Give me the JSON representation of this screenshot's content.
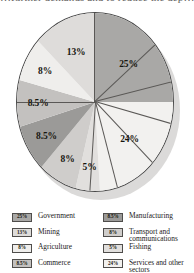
{
  "page": {
    "top_clipped_text": "…further demands and to reduce the dep…"
  },
  "chart_data": {
    "type": "pie",
    "title": "",
    "subtitle": "",
    "xlabel": "",
    "ylabel": "",
    "grid": false,
    "legend_position": "bottom",
    "start_angle_deg": 0,
    "direction": "clockwise",
    "total": 100,
    "unit": "%",
    "categories": [
      "Government",
      "Services and other sectors",
      "Fishing",
      "Transport and communications",
      "Manufacturing",
      "Commerce",
      "Agriculture",
      "Mining"
    ],
    "values": [
      25,
      24,
      5,
      8,
      8.5,
      8.5,
      8,
      13
    ],
    "colors": [
      "#a9a8a6",
      "#f2f1ef",
      "#e1dfdd",
      "#cfcdcb",
      "#9b9a98",
      "#c3c1bf",
      "#efeeec",
      "#dedcda"
    ],
    "slices": [
      {
        "label": "25%",
        "name": "Government",
        "value": 25,
        "color": "#a9a8a6"
      },
      {
        "label": "24%",
        "name": "Services and other sectors",
        "value": 24,
        "color": "#f2f1ef"
      },
      {
        "label": "5%",
        "name": "Fishing",
        "value": 5,
        "color": "#e1dfdd"
      },
      {
        "label": "8%",
        "name": "Transport and communications",
        "value": 8,
        "color": "#cfcdcb"
      },
      {
        "label": "8.5%",
        "name": "Manufacturing",
        "value": 8.5,
        "color": "#9b9a98"
      },
      {
        "label": "8.5%",
        "name": "Commerce",
        "value": 8.5,
        "color": "#c3c1bf"
      },
      {
        "label": "8%",
        "name": "Agriculture",
        "value": 8,
        "color": "#efeeec"
      },
      {
        "label": "13%",
        "name": "Mining",
        "value": 13,
        "color": "#dedcda"
      }
    ]
  },
  "legend": {
    "left_column": [
      {
        "pct": "25%",
        "label": "Government",
        "color": "#a9a8a6"
      },
      {
        "pct": "13%",
        "label": "Mining",
        "color": "#dedcda"
      },
      {
        "pct": "8%",
        "label": "Agriculture",
        "color": "#efeeec"
      },
      {
        "pct": "8.5%",
        "label": "Commerce",
        "color": "#c3c1bf"
      }
    ],
    "right_column": [
      {
        "pct": "8.5%",
        "label": "Manufacturing",
        "color": "#9b9a98"
      },
      {
        "pct": "8%",
        "label": "Transport and communications",
        "color": "#cfcdcb"
      },
      {
        "pct": "5%",
        "label": "Fishing",
        "color": "#e1dfdd"
      },
      {
        "pct": "24%",
        "label": "Services and other sectors",
        "color": "#f2f1ef"
      }
    ]
  }
}
